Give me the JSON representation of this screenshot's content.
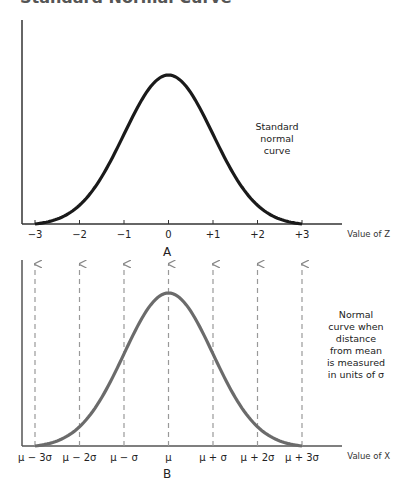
{
  "title": "Standard Normal Curve",
  "chart_data": [
    {
      "type": "line",
      "panel": "A",
      "title": "Standard Normal Curve",
      "xlabel": "Value of Z",
      "ylabel": "",
      "x_ticks": [
        "−3",
        "−2",
        "−1",
        "0",
        "+1",
        "+2",
        "+3"
      ],
      "x_range": [
        -3,
        3
      ],
      "annotation": [
        "Standard",
        "normal",
        "curve"
      ],
      "series": [
        {
          "name": "Standard normal curve",
          "mean": 0,
          "sd": 1
        }
      ],
      "grid": false,
      "line_color": "#1a1a1a"
    },
    {
      "type": "line",
      "panel": "B",
      "xlabel": "Value of X",
      "ylabel": "",
      "x_ticks": [
        "μ − 3σ",
        "μ − 2σ",
        "μ − σ",
        "μ",
        "μ + σ",
        "μ + 2σ",
        "μ + 3σ"
      ],
      "annotation": [
        "Normal",
        "curve when",
        "distance",
        "from mean",
        "is measured",
        "in units of σ"
      ],
      "series": [
        {
          "name": "Normal curve",
          "mean": "μ",
          "sd": "σ"
        }
      ],
      "reference_lines": "dashed vertical arrows at each tick",
      "grid": false,
      "line_color": "#6b6b6b"
    }
  ]
}
